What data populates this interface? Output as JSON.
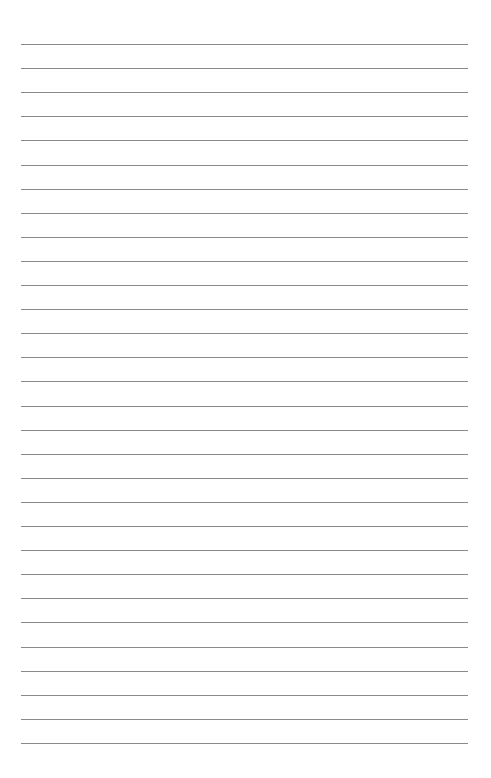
{
  "page": {
    "type": "lined-paper",
    "background_color": "#ffffff",
    "line_color": "#8a8a8a",
    "line_count": 30,
    "first_line_y": 44,
    "line_spacing": 24.1,
    "line_left": 21,
    "line_right": 468,
    "text_content": []
  }
}
